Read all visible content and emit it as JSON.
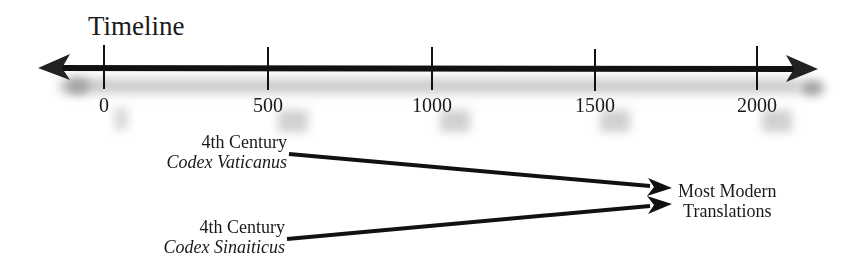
{
  "diagram": {
    "title": "Timeline",
    "axis": {
      "ticks": [
        {
          "label": "0",
          "x": 104
        },
        {
          "label": "500",
          "x": 268
        },
        {
          "label": "1000",
          "x": 432
        },
        {
          "label": "1500",
          "x": 595
        },
        {
          "label": "2000",
          "x": 757
        }
      ]
    },
    "manuscripts": [
      {
        "century": "4th Century",
        "name": "Codex Vaticanus"
      },
      {
        "century": "4th Century",
        "name": "Codex Sinaiticus"
      }
    ],
    "target": {
      "line1": "Most Modern",
      "line2": "Translations"
    },
    "colors": {
      "line": "#111111",
      "shadow": "#9a9a9a"
    }
  }
}
